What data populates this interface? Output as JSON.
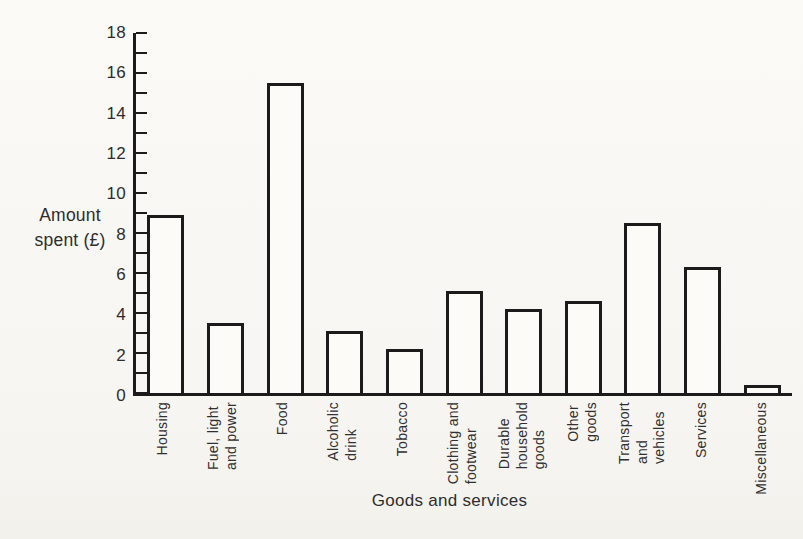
{
  "figure": {
    "background": "#faf9f6",
    "ink": "#1b1b1b",
    "text_color": "#2d2d2d"
  },
  "chart_data": {
    "type": "bar",
    "title": "",
    "xlabel": "Goods and services",
    "ylabel": "Amount spent (£)",
    "ylabel_lines": "Amount\nspent (£)",
    "ylim": [
      0,
      18
    ],
    "ytick_labels": [
      0,
      2,
      4,
      6,
      8,
      10,
      12,
      14,
      16,
      18
    ],
    "ytick_minor_step": 1,
    "grid": false,
    "legend": null,
    "bar_fill": "white",
    "bar_outline": "black",
    "categories": [
      "Housing",
      "Fuel, light\nand power",
      "Food",
      "Alcoholic\ndrink",
      "Tobacco",
      "Clothing and\nfootwear",
      "Durable\nhousehold\ngoods",
      "Other\ngoods",
      "Transport\nand\nvehicles",
      "Services",
      "Miscellaneous"
    ],
    "values": [
      8.9,
      3.5,
      15.5,
      3.1,
      2.2,
      5.1,
      4.2,
      4.6,
      8.5,
      6.3,
      0.4
    ]
  }
}
